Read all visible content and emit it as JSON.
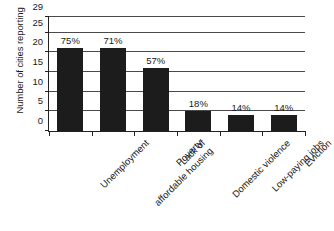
{
  "chart_data": {
    "type": "bar",
    "title": "",
    "xlabel": "",
    "ylabel": "Number of cities reporting",
    "ylim": [
      0,
      29
    ],
    "yticks": [
      0,
      5,
      10,
      15,
      20,
      25,
      29
    ],
    "ytick_labels": [
      "0",
      "5",
      "10",
      "15",
      "20",
      "25",
      "29"
    ],
    "grid": true,
    "legend": false,
    "categories": [
      "Unemployment",
      "Lack of affordable housing",
      "Poverty",
      "Domestic violence",
      "Low-paying jobs",
      "Eviction"
    ],
    "category_lines": [
      [
        "Unemployment"
      ],
      [
        "Lack of",
        "affordable housing"
      ],
      [
        "Poverty"
      ],
      [
        "Domestic violence"
      ],
      [
        "Low-paying jobs"
      ],
      [
        "Eviction"
      ]
    ],
    "values": [
      21,
      21,
      16,
      5,
      4,
      4
    ],
    "data_labels": [
      "75%",
      "71%",
      "57%",
      "18%",
      "14%",
      "14%"
    ],
    "bar_color": "#1c1c1c",
    "axis_color": "#222222",
    "grid_color": "#4a4a4a",
    "background": "#ffffff"
  }
}
